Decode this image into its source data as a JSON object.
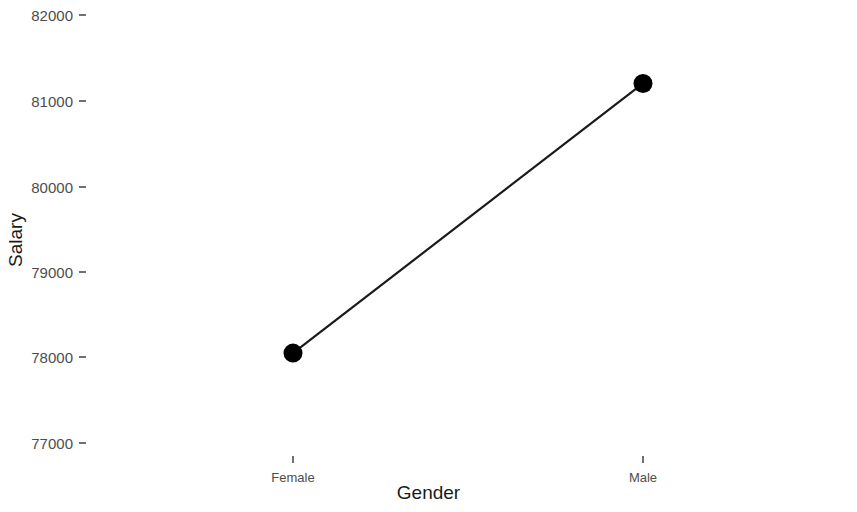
{
  "chart_data": {
    "type": "line",
    "title": "",
    "subtitle": "",
    "xlabel": "Gender",
    "ylabel": "Salary",
    "categories": [
      "Female",
      "Male"
    ],
    "values": [
      78050,
      81200
    ],
    "series": [
      {
        "name": "Mean Salary",
        "values": [
          78050,
          81200
        ]
      }
    ],
    "ylim": [
      76600,
      82250
    ],
    "yticks": [
      77000,
      78000,
      79000,
      80000,
      81000,
      82000
    ],
    "ytick_labels": [
      "77000",
      "78000",
      "79000",
      "80000",
      "81000",
      "82000"
    ],
    "xticks": [
      "Female",
      "Male"
    ],
    "grid": false,
    "legend": "none",
    "marker": "filled-circle",
    "marker_color": "#000000",
    "line_color": "#1a1a1a",
    "background_color": "#ffffff"
  },
  "axes": {
    "y_title": "Salary",
    "x_title": "Gender",
    "y_tick_0": "82000",
    "y_tick_1": "81000",
    "y_tick_2": "80000",
    "y_tick_3": "79000",
    "y_tick_4": "78000",
    "y_tick_5": "77000",
    "x_tick_0": "Female",
    "x_tick_1": "Male"
  }
}
